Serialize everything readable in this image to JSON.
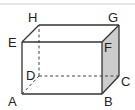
{
  "diagram": {
    "type": "rectangular-prism",
    "colors": {
      "edge": "#333333",
      "hidden_edge": "#444444",
      "shaded_face": "#cccccc",
      "top_rule": "#e6e6e6"
    },
    "vertices": {
      "A": {
        "label": "A",
        "x": 22,
        "y": 94
      },
      "B": {
        "label": "B",
        "x": 102,
        "y": 94
      },
      "C": {
        "label": "C",
        "x": 119,
        "y": 76
      },
      "D": {
        "label": "D",
        "x": 39,
        "y": 76
      },
      "E": {
        "label": "E",
        "x": 22,
        "y": 42
      },
      "F": {
        "label": "F",
        "x": 102,
        "y": 42
      },
      "G": {
        "label": "G",
        "x": 119,
        "y": 25
      },
      "H": {
        "label": "H",
        "x": 39,
        "y": 25
      }
    },
    "shaded_face": [
      "B",
      "C",
      "G",
      "F"
    ],
    "visible_edges": [
      "AB",
      "BC",
      "CG",
      "GF",
      "FB",
      "AE",
      "EF",
      "EH",
      "HG"
    ],
    "hidden_edges": [
      "AD",
      "DC",
      "DH"
    ]
  }
}
